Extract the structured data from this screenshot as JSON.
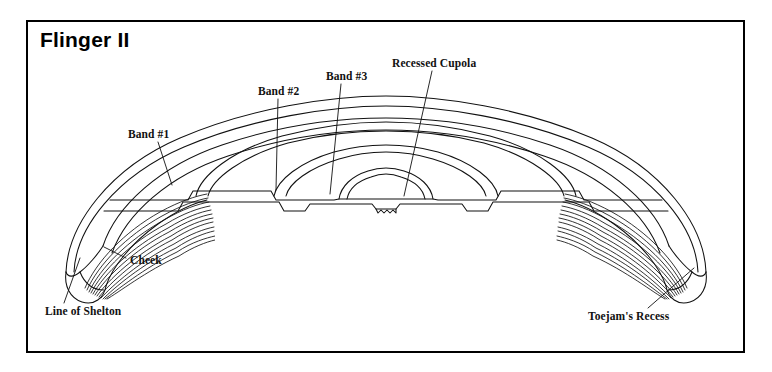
{
  "document": {
    "title": "Flinger II",
    "frame": {
      "border_color": "#000000",
      "background": "#ffffff"
    }
  },
  "figure": {
    "type": "technical-cross-section",
    "ink_color": "#111111",
    "labels": [
      {
        "key": "band1",
        "text": "Band #1",
        "x": 128,
        "y": 135,
        "anchor": "start"
      },
      {
        "key": "band2",
        "text": "Band #2",
        "x": 258,
        "y": 92,
        "anchor": "start"
      },
      {
        "key": "band3",
        "text": "Band #3",
        "x": 326,
        "y": 77,
        "anchor": "start"
      },
      {
        "key": "cupola",
        "text": "Recessed Cupola",
        "x": 392,
        "y": 64,
        "anchor": "start"
      },
      {
        "key": "cheek",
        "text": "Cheek",
        "x": 130,
        "y": 261,
        "anchor": "start"
      },
      {
        "key": "shelton",
        "text": "Line of Shelton",
        "x": 45,
        "y": 312,
        "anchor": "start"
      },
      {
        "key": "toejam",
        "text": "Toejam's Recess",
        "x": 588,
        "y": 317,
        "anchor": "start"
      }
    ],
    "leaders": [
      {
        "key": "band1",
        "from": [
          158,
          142
        ],
        "to": [
          172,
          185
        ]
      },
      {
        "key": "band2",
        "from": [
          278,
          99
        ],
        "to": [
          276,
          190
        ]
      },
      {
        "key": "band3",
        "from": [
          341,
          84
        ],
        "to": [
          330,
          194
        ]
      },
      {
        "key": "cupola",
        "from": [
          432,
          71
        ],
        "to": [
          404,
          196
        ]
      },
      {
        "key": "cheek",
        "from": [
          126,
          258
        ],
        "to": [
          104,
          247
        ]
      },
      {
        "key": "shelton",
        "from": [
          64,
          303
        ],
        "to": [
          80,
          258
        ]
      },
      {
        "key": "toejam",
        "from": [
          648,
          308
        ],
        "to": [
          694,
          268
        ]
      }
    ]
  }
}
